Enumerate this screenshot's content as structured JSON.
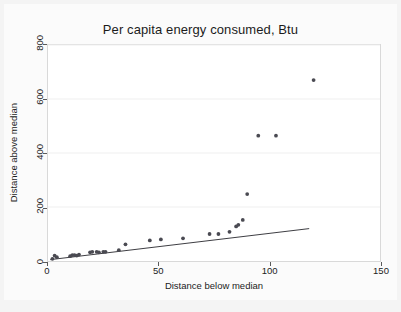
{
  "chart_data": {
    "type": "scatter",
    "title": "Per capita energy consumed, Btu",
    "xlabel": "Distance below median",
    "ylabel": "Distance above median",
    "xlim": [
      0,
      150
    ],
    "ylim": [
      0,
      800
    ],
    "xticks": [
      0,
      50,
      100,
      150
    ],
    "yticks": [
      0,
      200,
      400,
      600,
      800
    ],
    "grid": true,
    "legend": null,
    "series": [
      {
        "name": "observations",
        "marker": "filled-circle",
        "color": "#4a4a52",
        "points": [
          [
            2,
            8
          ],
          [
            3,
            20
          ],
          [
            4,
            14
          ],
          [
            10,
            18
          ],
          [
            11,
            22
          ],
          [
            12,
            22
          ],
          [
            13,
            20
          ],
          [
            14,
            24
          ],
          [
            19,
            32
          ],
          [
            20,
            34
          ],
          [
            22,
            34
          ],
          [
            23,
            32
          ],
          [
            25,
            34
          ],
          [
            26,
            34
          ],
          [
            32,
            40
          ],
          [
            35,
            62
          ],
          [
            46,
            76
          ],
          [
            51,
            80
          ],
          [
            61,
            84
          ],
          [
            73,
            100
          ],
          [
            77,
            100
          ],
          [
            82,
            108
          ],
          [
            85,
            128
          ],
          [
            86,
            134
          ],
          [
            88,
            152
          ],
          [
            90,
            248
          ],
          [
            95,
            464
          ],
          [
            103,
            464
          ],
          [
            120,
            670
          ]
        ]
      }
    ],
    "fit_line": {
      "name": "linear fit",
      "color": "#3c3c42",
      "x_start": 1,
      "y_start": 5,
      "x_end": 118,
      "y_end": 120
    }
  }
}
